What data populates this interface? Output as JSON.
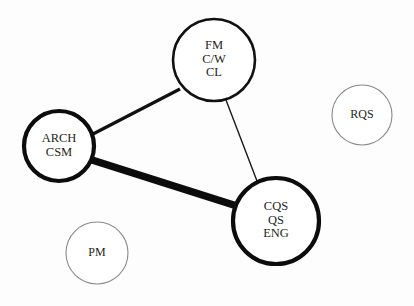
{
  "diagram": {
    "type": "node-link-network",
    "background_color": "#fdfdfd",
    "width": 414,
    "height": 306,
    "nodes": [
      {
        "id": "fm",
        "name": "fm-node",
        "lines": [
          "FM",
          "C/W",
          "CL"
        ],
        "cx": 214,
        "cy": 60,
        "r": 41,
        "stroke": "#111111",
        "stroke_width": 2.6,
        "font_size": 12.5,
        "line_height": 13.5,
        "fill": "#ffffff"
      },
      {
        "id": "arch",
        "name": "arch-csm-node",
        "lines": [
          "ARCH",
          "CSM"
        ],
        "cx": 59,
        "cy": 146,
        "r": 35,
        "stroke": "#0c0c0c",
        "stroke_width": 4.2,
        "font_size": 12.5,
        "line_height": 14,
        "fill": "#ffffff"
      },
      {
        "id": "cqs",
        "name": "cqs-qs-eng-node",
        "lines": [
          "CQS",
          "QS",
          "ENG"
        ],
        "cx": 276,
        "cy": 221,
        "r": 43,
        "stroke": "#0c0c0c",
        "stroke_width": 4.2,
        "font_size": 12.5,
        "line_height": 13.5,
        "fill": "#ffffff"
      },
      {
        "id": "rqs",
        "name": "rqs-node",
        "lines": [
          "RQS"
        ],
        "cx": 362,
        "cy": 115,
        "r": 30,
        "stroke": "#8a8a8a",
        "stroke_width": 1.1,
        "font_size": 12,
        "line_height": 13,
        "fill": "#ffffff"
      },
      {
        "id": "pm",
        "name": "pm-node",
        "lines": [
          "PM"
        ],
        "cx": 97,
        "cy": 253,
        "r": 31,
        "stroke": "#8a8a8a",
        "stroke_width": 1.1,
        "font_size": 12,
        "line_height": 13,
        "fill": "#ffffff"
      }
    ],
    "edges": [
      {
        "id": "arch-cqs",
        "name": "edge-arch-cqs",
        "source": "arch",
        "target": "cqs",
        "x1": 92,
        "y1": 160,
        "x2": 240,
        "y2": 207,
        "stroke": "#0c0c0c",
        "stroke_width": 7.5,
        "weight": "very-thick"
      },
      {
        "id": "arch-fm",
        "name": "edge-arch-fm",
        "source": "arch",
        "target": "fm",
        "x1": 93,
        "y1": 134,
        "x2": 180,
        "y2": 89,
        "stroke": "#111111",
        "stroke_width": 3.2,
        "weight": "medium"
      },
      {
        "id": "fm-cqs",
        "name": "edge-fm-cqs",
        "source": "fm",
        "target": "cqs",
        "x1": 226,
        "y1": 100,
        "x2": 257,
        "y2": 181,
        "stroke": "#1a1a1a",
        "stroke_width": 1.4,
        "weight": "thin"
      }
    ]
  }
}
